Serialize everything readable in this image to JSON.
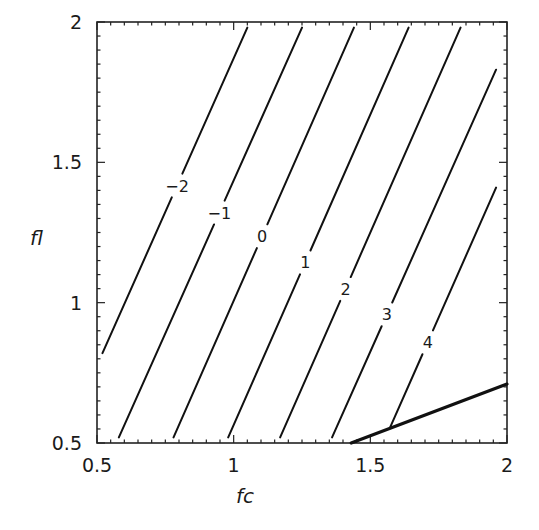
{
  "chart_data": {
    "type": "contour",
    "title": "",
    "xlabel": "fc",
    "ylabel": "fl",
    "xlim": [
      0.5,
      2
    ],
    "ylim": [
      0.5,
      2
    ],
    "x_ticks": [
      "0.5",
      "1",
      "1.5",
      "2"
    ],
    "y_ticks": [
      "0.5",
      "1",
      "1.5",
      "2"
    ],
    "grid": false,
    "legend": null,
    "contours": [
      {
        "level": "-2",
        "label": "−2",
        "start": [
          0.52,
          0.82
        ],
        "end": [
          1.05,
          1.98
        ],
        "label_pos": [
          0.81,
          1.41
        ]
      },
      {
        "level": "-1",
        "label": "−1",
        "start": [
          0.58,
          0.52
        ],
        "end": [
          1.25,
          1.98
        ],
        "label_pos": [
          0.95,
          1.32
        ]
      },
      {
        "level": "0",
        "label": "0",
        "start": [
          0.78,
          0.52
        ],
        "end": [
          1.44,
          1.98
        ],
        "label_pos": [
          1.12,
          1.23
        ]
      },
      {
        "level": "1",
        "label": "1",
        "start": [
          0.98,
          0.52
        ],
        "end": [
          1.64,
          1.98
        ],
        "label_pos": [
          1.27,
          1.14
        ]
      },
      {
        "level": "2",
        "label": "2",
        "start": [
          1.17,
          0.52
        ],
        "end": [
          1.83,
          1.98
        ],
        "label_pos": [
          1.43,
          1.04
        ]
      },
      {
        "level": "3",
        "label": "3",
        "start": [
          1.36,
          0.52
        ],
        "end": [
          1.96,
          1.83
        ],
        "label_pos": [
          1.58,
          0.95
        ]
      },
      {
        "level": "4",
        "label": "4",
        "start": [
          1.57,
          0.55
        ],
        "end": [
          1.96,
          1.41
        ],
        "label_pos": [
          1.73,
          0.85
        ]
      }
    ],
    "boundary": {
      "style": "thick",
      "start": [
        1.43,
        0.5
      ],
      "end": [
        2.0,
        0.71
      ]
    }
  },
  "axes": {
    "x_label": "fc",
    "y_label": "fl",
    "x_tick_labels": [
      "0.5",
      "1",
      "1.5",
      "2"
    ],
    "y_tick_labels": [
      "0.5",
      "1",
      "1.5",
      "2"
    ]
  }
}
